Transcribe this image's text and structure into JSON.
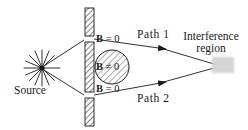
{
  "figure": {
    "type": "physics-diagram",
    "background_color": "#ffffff",
    "line_color": "#1a1a1a",
    "hatch_color": "#555555",
    "region_color": "#d4d4d4",
    "width": 248,
    "height": 130
  },
  "labels": {
    "source": "Source",
    "path1": "Path 1",
    "path2": "Path 2",
    "interference_line1": "Interference",
    "interference_line2": "region",
    "field_zero_top_symbol": "B",
    "field_zero_top_relation": " = 0",
    "field_zero_bottom_symbol": "B",
    "field_zero_bottom_relation": " = 0",
    "field_nonzero_symbol": "B",
    "field_nonzero_relation": " ≠ 0"
  },
  "elements": {
    "source_point": {
      "name": "source-starburst",
      "x": 42,
      "y": 68,
      "rays": 12
    },
    "barrier": {
      "name": "slit-barrier",
      "x": 85,
      "segments": [
        {
          "top": 8,
          "height": 28
        },
        {
          "top": 42,
          "height": 50
        },
        {
          "top": 98,
          "height": 28
        }
      ],
      "width": 9
    },
    "solenoid_circle": {
      "name": "magnetic-flux-region",
      "cx": 112,
      "cy": 67,
      "r": 17
    },
    "interference_region": {
      "name": "interference-region-patch",
      "x": 212,
      "y": 57,
      "w": 22,
      "h": 16
    },
    "path1_arrow": {
      "name": "path1-arrowhead",
      "x": 166,
      "y": 49
    },
    "path2_arrow": {
      "name": "path2-arrowhead",
      "x": 166,
      "y": 82
    }
  }
}
